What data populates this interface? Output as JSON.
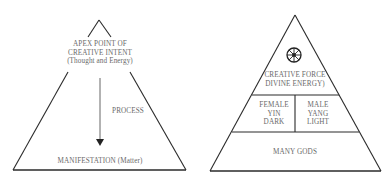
{
  "left_diagram": {
    "apex_label": [
      "APEX POINT OF",
      "CREATIVE INTENT",
      "(Thought and Energy)"
    ],
    "process_label": "PROCESS",
    "base_label": "MANIFESTATION (Matter)",
    "arrow_direction": "down"
  },
  "right_diagram": {
    "top_icon": "eight-spoked-wheel-icon",
    "top_label": [
      "CREATIVE FORCE",
      "DIVINE ENERGY)"
    ],
    "middle_left_label": [
      "FEMALE",
      "YIN",
      "DARK"
    ],
    "middle_right_label": [
      "MALE",
      "YANG",
      "LIGHT"
    ],
    "base_label": "MANY GODS"
  },
  "colors": {
    "line": "#2a2a2a",
    "text": "#6a6a6a",
    "background": "#ffffff"
  }
}
